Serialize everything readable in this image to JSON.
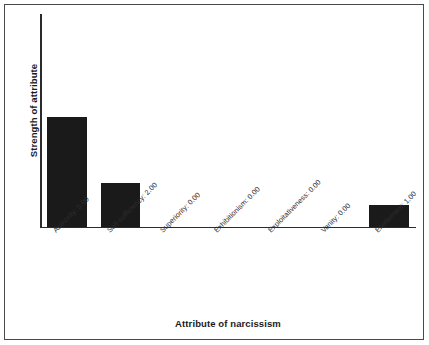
{
  "figure": {
    "background_color": "#ffffff",
    "frame_color": "#4a4a4a",
    "bar_color": "#1a1a1a",
    "axis_color": "#2b2b2b"
  },
  "chart_data": {
    "type": "bar",
    "title": "",
    "xlabel": "Attribute of narcissism",
    "ylabel": "Strength of attribute",
    "categories": [
      "Authority",
      "Self-sufficiency",
      "Superiority",
      "Exhibitionism",
      "Exploitativeness",
      "Vanity",
      "Entitlement"
    ],
    "tick_labels": [
      "Authority: 5.00",
      "Self-sufficiency: 2.00",
      "Superiority: 0.00",
      "Exhibitionism: 0.00",
      "Exploitativeness: 0.00",
      "Vanity: 0.00",
      "Entitlement: 1.00"
    ],
    "values": [
      5.0,
      2.0,
      0.0,
      0.0,
      0.0,
      0.0,
      1.0
    ],
    "ylim": [
      0,
      9.7
    ],
    "grid": false,
    "legend": false,
    "y_ticks_shown": false,
    "x_ticks_shown": false,
    "bar_width_fraction": 0.74
  }
}
